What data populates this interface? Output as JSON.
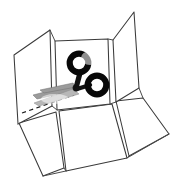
{
  "figure": {
    "background_color": "#ffffff",
    "width": 181,
    "height": 183
  },
  "styles": {
    "line_color": "#3a3a3a",
    "fold_line_color": "#4a4a4a",
    "dash_color": "#1d1d1d",
    "scissor_handle_color": "#080808",
    "scissor_blade_color": "#9b9b9b",
    "panel_fill": "#ffffff"
  },
  "objects": {
    "box": {
      "label": "unfolded-box",
      "panel_count": 6,
      "panels": [
        {
          "name": "left-upright-flap",
          "points": "14,55 50,30 52,106 18,124"
        },
        {
          "name": "back-upright-panel",
          "points": "55,41 108,39 110,104 57,110"
        },
        {
          "name": "right-upright-flap",
          "points": "113,40 134,12 139,88 116,102"
        },
        {
          "name": "bottom-left-flap",
          "points": "19,123 56,112 64,168 43,176"
        },
        {
          "name": "bottom-center-panel",
          "points": "59,111 112,104 127,158 66,171"
        },
        {
          "name": "bottom-right-flap",
          "points": "116,101 143,98 169,134 129,156"
        }
      ]
    },
    "cut_line": {
      "label": "dashed-cut-line",
      "from": [
        22,
        113
      ],
      "to": [
        74,
        95
      ],
      "style": "dashed"
    },
    "scissors": {
      "label": "scissors",
      "orientation": "pointing-down-left",
      "ring_upper": {
        "cx": 79,
        "cy": 63,
        "r": 9.5
      },
      "ring_lower": {
        "cx": 97,
        "cy": 85,
        "r": 9.5
      },
      "pivot": [
        76,
        88
      ],
      "blade_tip": [
        33,
        95
      ]
    }
  }
}
